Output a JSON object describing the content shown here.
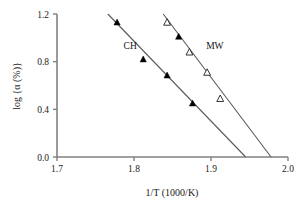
{
  "chart_data": {
    "type": "scatter",
    "title": "",
    "xlabel": "1/T  (1000/K)",
    "ylabel": "log {α (%)}",
    "xlim": [
      1.7,
      2.0
    ],
    "ylim": [
      0.0,
      1.2
    ],
    "xticks": [
      "1.7",
      "1.8",
      "1.9",
      "2.0"
    ],
    "xtick_values": [
      1.7,
      1.8,
      1.9,
      2.0
    ],
    "yticks": [
      "0.0",
      "0.4",
      "0.8",
      "1.2"
    ],
    "ytick_values": [
      0.0,
      0.4,
      0.8,
      1.2
    ],
    "grid": false,
    "legend": "inline-annotations",
    "series": [
      {
        "name": "CH",
        "marker": "filled-triangle",
        "label_x": 1.795,
        "label_y": 0.905,
        "points": [
          {
            "x": 1.778,
            "y": 1.13
          },
          {
            "x": 1.812,
            "y": 0.82
          },
          {
            "x": 1.843,
            "y": 0.685
          },
          {
            "x": 1.858,
            "y": 1.01
          },
          {
            "x": 1.876,
            "y": 0.45
          }
        ],
        "fit": {
          "x1": 1.766,
          "y1": 1.2,
          "x2": 1.945,
          "y2": 0.0
        }
      },
      {
        "name": "MW",
        "marker": "open-triangle",
        "label_x": 1.905,
        "label_y": 0.905,
        "points": [
          {
            "x": 1.843,
            "y": 1.13
          },
          {
            "x": 1.872,
            "y": 0.88
          },
          {
            "x": 1.895,
            "y": 0.71
          },
          {
            "x": 1.912,
            "y": 0.49
          }
        ],
        "fit": {
          "x1": 1.838,
          "y1": 1.2,
          "x2": 1.978,
          "y2": 0.0
        }
      }
    ]
  },
  "axes": {
    "x_title": "1/T  (1000/K)",
    "y_title": "log {α (%)}"
  },
  "annotations": {
    "ch_label": "CH",
    "mw_label": "MW"
  },
  "colors": {
    "axis": "#808080",
    "line": "#5a5a5a",
    "marker_filled": "#000000",
    "marker_open": "#ffffff",
    "text": "#1a1a1a"
  }
}
